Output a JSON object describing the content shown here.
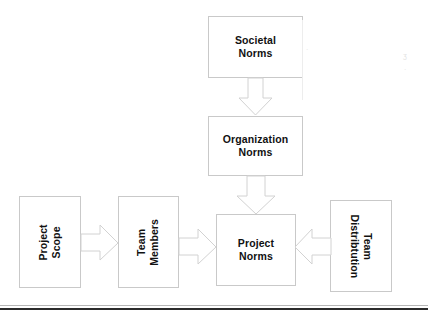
{
  "diagram": {
    "type": "flowchart",
    "background_color": "#ffffff",
    "box_border_color": "#c9c9c9",
    "arrow_fill_color": "#ffffff",
    "arrow_stroke_color": "#d2d2d2",
    "text_color": "#111111",
    "rule_color": "#2b2b2b",
    "nodes": [
      {
        "id": "societal-norms",
        "label": "Societal\nNorms",
        "orientation": "horizontal",
        "x": 208,
        "y": 16,
        "w": 95,
        "h": 62
      },
      {
        "id": "organization-norms",
        "label": "Organization\nNorms",
        "orientation": "horizontal",
        "x": 208,
        "y": 116,
        "w": 95,
        "h": 60
      },
      {
        "id": "project-norms",
        "label": "Project\nNorms",
        "orientation": "horizontal",
        "x": 216,
        "y": 214,
        "w": 80,
        "h": 72
      },
      {
        "id": "project-scope",
        "label": "Project\nScope",
        "orientation": "vertical-up",
        "x": 19,
        "y": 196,
        "w": 62,
        "h": 92
      },
      {
        "id": "team-members",
        "label": "Team\nMembers",
        "orientation": "vertical-up",
        "x": 118,
        "y": 196,
        "w": 61,
        "h": 92
      },
      {
        "id": "team-distribution",
        "label": "Team\nDistribtution",
        "orientation": "vertical-down",
        "x": 330,
        "y": 200,
        "w": 62,
        "h": 92
      }
    ],
    "connectors": [
      {
        "id": "societal-to-organization",
        "from": "societal-norms",
        "to": "organization-norms",
        "direction": "down"
      },
      {
        "id": "organization-to-project",
        "from": "organization-norms",
        "to": "project-norms",
        "direction": "down"
      },
      {
        "id": "scope-to-members",
        "from": "project-scope",
        "to": "team-members",
        "direction": "right"
      },
      {
        "id": "members-to-project",
        "from": "team-members",
        "to": "project-norms",
        "direction": "right"
      },
      {
        "id": "distribution-to-project",
        "from": "team-distribution",
        "to": "project-norms",
        "direction": "left"
      }
    ],
    "rule": {
      "id": "bottom-rule",
      "y": 308
    }
  }
}
